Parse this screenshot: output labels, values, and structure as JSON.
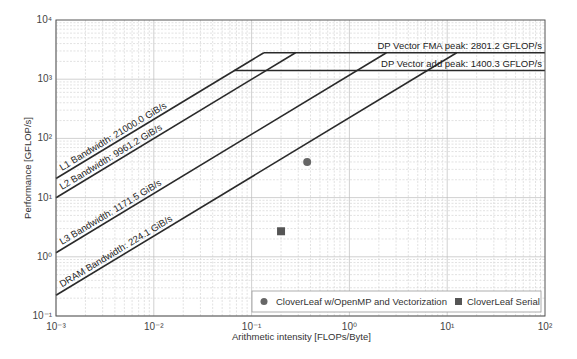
{
  "chart_data": {
    "type": "scatter",
    "subtype": "roofline",
    "title": "",
    "xlabel": "Arithmetic intensity [FLOPs/Byte]",
    "ylabel": "Performance [GFLOP/s]",
    "xscale": "log",
    "yscale": "log",
    "xlim": [
      0.001,
      100
    ],
    "ylim": [
      0.1,
      10000
    ],
    "grid": true,
    "x_tick_labels": [
      "10⁻³",
      "10⁻²",
      "10⁻¹",
      "10⁰",
      "10¹",
      "10²"
    ],
    "y_tick_labels": [
      "10⁻¹",
      "10⁰",
      "10¹",
      "10²",
      "10³",
      "10⁴"
    ],
    "compute_roofs": [
      {
        "name": "DP Vector FMA peak",
        "value": 2801.2,
        "unit": "GFLOP/s",
        "label": "DP Vector FMA peak: 2801.2 GFLOP/s"
      },
      {
        "name": "DP Vector add peak",
        "value": 1400.3,
        "unit": "GFLOP/s",
        "label": "DP Vector add peak: 1400.3 GFLOP/s"
      }
    ],
    "bandwidth_roofs": [
      {
        "name": "L1 Bandwidth",
        "value": 21000.0,
        "unit": "GiB/s",
        "label": "L1 Bandwidth: 21000.0 GiB/s"
      },
      {
        "name": "L2 Bandwidth",
        "value": 9961.2,
        "unit": "GiB/s",
        "label": "L2 Bandwidth: 9961.2 GiB/s"
      },
      {
        "name": "L3 Bandwidth",
        "value": 1171.5,
        "unit": "GiB/s",
        "label": "L3 Bandwidth: 1171.5 GiB/s"
      },
      {
        "name": "DRAM Bandwidth",
        "value": 224.1,
        "unit": "GiB/s",
        "label": "DRAM Bandwidth: 224.1 GiB/s"
      }
    ],
    "series": [
      {
        "name": "CloverLeaf w/OpenMP and Vectorization",
        "marker": "circle",
        "color": "#666666",
        "points": [
          {
            "x": 0.37,
            "y": 40
          }
        ]
      },
      {
        "name": "CloverLeaf Serial",
        "marker": "square",
        "color": "#555555",
        "points": [
          {
            "x": 0.2,
            "y": 2.7
          }
        ]
      }
    ],
    "legend_position": "lower right"
  },
  "colors": {
    "roof_line": "#2a2a2a",
    "grid_major": "#bdbdbd",
    "grid_minor": "#d6d6d6",
    "axis": "#555555"
  }
}
